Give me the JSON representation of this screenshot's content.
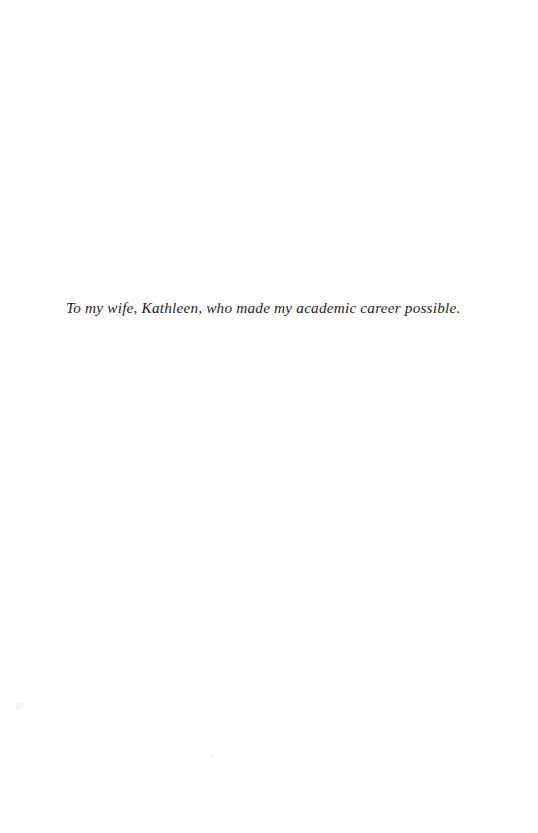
{
  "page": {
    "type": "book-dedication-page",
    "background_color": "#ffffff",
    "width": 538,
    "height": 833
  },
  "dedication": {
    "text": "To my wife, Kathleen, who made my academic career possible.",
    "style": "italic",
    "color": "#231f20"
  },
  "artifacts": {
    "speck_left": "",
    "speck_center": ""
  }
}
